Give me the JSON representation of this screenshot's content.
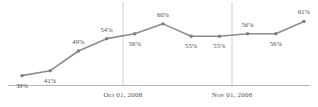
{
  "chart_data": {
    "type": "line",
    "title": "",
    "xlabel": "",
    "ylabel": "",
    "grid": true,
    "legend": false,
    "legend_position": "none",
    "ylim": [
      35,
      64
    ],
    "series": [
      {
        "name": "",
        "color": "#8c8c8c",
        "values": [
          39,
          41,
          49,
          54,
          56,
          60,
          55,
          55,
          56,
          56,
          61
        ]
      }
    ],
    "point_labels": [
      "39%",
      "41%",
      "49%",
      "54%",
      "56%",
      "60%",
      "55%",
      "55%",
      "56%",
      "56%",
      "61%"
    ],
    "label_placement": [
      "below",
      "below",
      "above",
      "above",
      "below",
      "above",
      "below",
      "below",
      "above",
      "below",
      "above"
    ],
    "categories": [
      "1",
      "2",
      "3",
      "4",
      "5",
      "6",
      "7",
      "8",
      "9",
      "10",
      "11"
    ],
    "xtick_labels": [
      "Oct 01, 2008",
      "Nov 01, 2008"
    ],
    "xtick_positions": [
      123,
      232
    ]
  },
  "colors": {
    "line": "#8c8c8c",
    "marker": "#7f7f7f",
    "gridline": "#cfcfcf",
    "axis": "#b5b5b5",
    "label_text": "#4a4a4a",
    "axis_text": "#4f4f4f",
    "background": "#ffffff"
  }
}
